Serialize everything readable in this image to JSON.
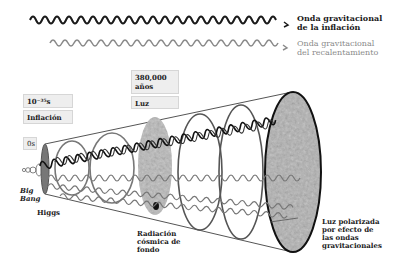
{
  "legend": {
    "inflation_wave": {
      "line1": "Onda gravitacional",
      "line2": "de la inflación",
      "color": "#1a1a1a"
    },
    "reheating_wave": {
      "line1": "Onda gravitacional",
      "line2": "del recalentamiento",
      "color": "#8a8a8a"
    }
  },
  "timeline_boxes": {
    "zero": {
      "label": "0s"
    },
    "inflation_time": {
      "label": "10⁻³⁵s"
    },
    "inflation": {
      "label": "Inflación"
    },
    "cmb_time": {
      "label": "380,000 años"
    },
    "light": {
      "label": "Luz"
    }
  },
  "captions": {
    "big_bang": {
      "line1": "Big",
      "line2": "Bang"
    },
    "higgs": "Higgs",
    "cmb": {
      "line1": "Radiación",
      "line2": "cósmica de",
      "line3": "fondo"
    },
    "polarized_light": {
      "line1": "Luz polarizada",
      "line2": "por efecto de",
      "line3": "las ondas",
      "line4": "gravitacionales"
    }
  }
}
